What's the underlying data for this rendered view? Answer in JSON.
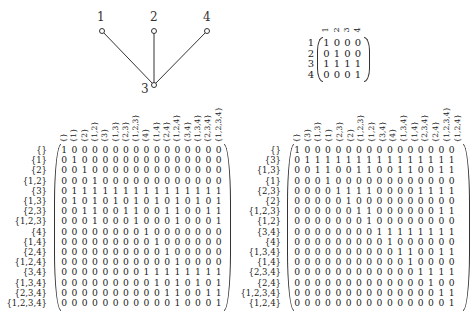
{
  "graph": {
    "nodes": [
      {
        "label": "1",
        "x": 102,
        "y": 31
      },
      {
        "label": "2",
        "x": 154,
        "y": 31
      },
      {
        "label": "4",
        "x": 207,
        "y": 31
      },
      {
        "label": "3",
        "x": 154,
        "y": 85
      }
    ],
    "edges": [
      [
        "1",
        "3"
      ],
      [
        "2",
        "3"
      ],
      [
        "4",
        "3"
      ]
    ]
  },
  "small_matrix": {
    "col_labels": [
      "1",
      "2",
      "3",
      "4"
    ],
    "row_labels": [
      "1",
      "2",
      "3",
      "4"
    ],
    "rows": [
      [
        1,
        0,
        0,
        0
      ],
      [
        0,
        1,
        0,
        0
      ],
      [
        1,
        1,
        1,
        1
      ],
      [
        0,
        0,
        0,
        1
      ]
    ]
  },
  "left_matrix": {
    "col_labels": [
      "{}",
      "{1}",
      "{2}",
      "{1,2}",
      "{3}",
      "{1,3}",
      "{2,3}",
      "{1,2,3}",
      "{4}",
      "{1,4}",
      "{2,4}",
      "{1,2,4}",
      "{3,4}",
      "{1,3,4}",
      "{2,3,4}",
      "{1,2,3,4}"
    ],
    "row_labels": [
      "{}",
      "{1}",
      "{2}",
      "{1,2}",
      "{3}",
      "{1,3}",
      "{2,3}",
      "{1,2,3}",
      "{4}",
      "{1,4}",
      "{2,4}",
      "{1,2,4}",
      "{3,4}",
      "{1,3,4}",
      "{2,3,4}",
      "{1,2,3,4}"
    ],
    "rows": [
      "1 0 0 0 0 0 0 0 0 0 0 0 0 0 0 0",
      "0 1 0 0 0 0 0 0 0 0 0 0 0 0 0 0",
      "0 0 1 0 0 0 0 0 0 0 0 0 0 0 0 0",
      "0 0 0 1 0 0 0 0 0 0 0 0 0 0 0 0",
      "0 1 1 1 1 1 1 1 1 1 1 1 1 1 1 1",
      "0 1 0 1 0 1 0 1 0 1 0 1 0 1 0 1",
      "0 0 1 1 0 0 1 1 0 0 1 1 0 0 1 1",
      "0 0 0 1 0 0 0 1 0 0 0 1 0 0 0 1",
      "0 0 0 0 0 0 0 0 1 0 0 0 0 0 0 0",
      "0 0 0 0 0 0 0 0 0 1 0 0 0 0 0 0",
      "0 0 0 0 0 0 0 0 0 0 1 0 0 0 0 0",
      "0 0 0 0 0 0 0 0 0 0 0 1 0 0 0 0",
      "0 0 0 0 0 0 0 0 1 1 1 1 1 1 1 1",
      "0 0 0 0 0 0 0 0 0 1 0 1 0 1 0 1",
      "0 0 0 0 0 0 0 0 0 0 1 1 0 0 1 1",
      "0 0 0 0 0 0 0 0 0 0 0 1 0 0 0 1"
    ]
  },
  "right_matrix": {
    "col_labels": [
      "{}",
      "{3}",
      "{1,3}",
      "{1}",
      "{2,3}",
      "{2}",
      "{1,2,3}",
      "{1,2}",
      "{3,4}",
      "{4}",
      "{1,3,4}",
      "{1,4}",
      "{2,3,4}",
      "{2,4}",
      "{1,2,3,4}",
      "{1,2,4}"
    ],
    "row_labels": [
      "{}",
      "{3}",
      "{1,3}",
      "{1}",
      "{2,3}",
      "{2}",
      "{1,2,3}",
      "{1,2}",
      "{3,4}",
      "{4}",
      "{1,3,4}",
      "{1,4}",
      "{2,3,4}",
      "{2,4}",
      "{1,2,3,4}",
      "{1,2,4}"
    ],
    "rows": [
      "1 0 0 0 0 0 0 0 0 0 0 0 0 0 0 0",
      "0 1 1 1 1 1 1 1 1 1 1 1 1 1 1 1",
      "0 0 1 1 0 0 1 1 0 0 1 1 0 0 1 1",
      "0 0 0 1 0 0 0 0 0 0 0 0 0 0 0 0",
      "0 0 0 0 1 1 1 1 0 0 0 0 1 1 1 1",
      "0 0 0 0 0 1 0 0 0 0 0 0 0 0 0 0",
      "0 0 0 0 0 0 1 1 0 0 0 0 0 0 1 1",
      "0 0 0 0 0 0 0 1 0 0 0 0 0 0 0 0",
      "0 0 0 0 0 0 0 0 1 1 1 1 1 1 1 1",
      "0 0 0 0 0 0 0 0 0 1 0 0 0 0 0 0",
      "0 0 0 0 0 0 0 0 0 0 1 1 0 0 1 1",
      "0 0 0 0 0 0 0 0 0 0 0 1 0 0 0 0",
      "0 0 0 0 0 0 0 0 0 0 0 0 1 1 1 1",
      "0 0 0 0 0 0 0 0 0 0 0 0 0 1 0 0",
      "0 0 0 0 0 0 0 0 0 0 0 0 0 0 1 1",
      "0 0 0 0 0 0 0 0 0 0 0 0 0 0 0 1"
    ]
  }
}
